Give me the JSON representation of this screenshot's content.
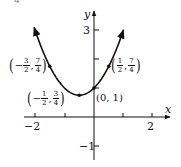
{
  "corner_label": "4",
  "chart_data": {
    "type": "line",
    "title": "",
    "function": "y = x^2 + x + 1",
    "xlabel": "x",
    "ylabel": "y",
    "xlim": [
      -2.3,
      2.8
    ],
    "ylim": [
      -1.4,
      3.8
    ],
    "grid": false,
    "x_ticks": [
      -2,
      -1,
      1,
      2
    ],
    "x_tick_labels": [
      "-2",
      "2"
    ],
    "y_ticks": [
      -1,
      1,
      3
    ],
    "y_tick_labels": [
      "-1",
      "3"
    ],
    "series": [
      {
        "name": "parabola",
        "x": [
          -2.0,
          -1.5,
          -1.0,
          -0.5,
          0.0,
          0.5,
          1.0
        ],
        "y": [
          3.0,
          1.75,
          1.0,
          0.75,
          1.0,
          1.75,
          3.0
        ],
        "arrows_at_ends": true
      }
    ],
    "annotations": [
      {
        "x": -1.5,
        "y": 1.75,
        "label": "(-3/2, 7/4)",
        "num_x": "3",
        "den_x": "2",
        "neg_x": true,
        "num_y": "7",
        "den_y": "4"
      },
      {
        "x": -0.5,
        "y": 0.75,
        "label": "(-1/2, 3/4)",
        "num_x": "1",
        "den_x": "2",
        "neg_x": true,
        "num_y": "3",
        "den_y": "4"
      },
      {
        "x": 0.0,
        "y": 1.0,
        "label": "(0, 1)"
      },
      {
        "x": 0.5,
        "y": 1.75,
        "label": "(1/2, 7/4)",
        "num_x": "1",
        "den_x": "2",
        "neg_x": false,
        "num_y": "7",
        "den_y": "4"
      }
    ]
  },
  "labels": {
    "x_axis": "x",
    "y_axis": "y",
    "tick_neg2": "−2",
    "tick_2": "2",
    "tick_3": "3",
    "tick_neg1": "−1",
    "point_origin": "(0, 1)",
    "minus": "−",
    "comma": ",",
    "lparen": "(",
    "rparen": ")"
  }
}
